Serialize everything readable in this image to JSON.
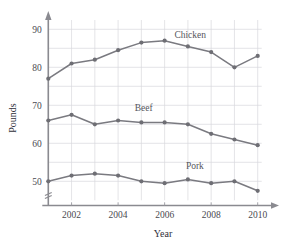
{
  "chart_data": {
    "type": "line",
    "title": "",
    "subtitle": "",
    "xlabel": "Year",
    "ylabel": "Pounds",
    "x": [
      2001,
      2002,
      2003,
      2004,
      2005,
      2006,
      2007,
      2008,
      2009,
      2010
    ],
    "xlim": [
      2001,
      2010
    ],
    "ylim": [
      46,
      92
    ],
    "xtick_labels": [
      "2002",
      "2004",
      "2006",
      "2008",
      "2010"
    ],
    "xtick_values": [
      2002,
      2004,
      2006,
      2008,
      2010
    ],
    "ytick_labels": [
      "50",
      "60",
      "70",
      "80",
      "90"
    ],
    "ytick_values": [
      50,
      60,
      70,
      80,
      90
    ],
    "grid": true,
    "grid_x_step": 1,
    "grid_y_step": 5,
    "y_axis_break": true,
    "legend_position": "inline-annotations",
    "series": [
      {
        "name": "Chicken",
        "label": "Chicken",
        "label_x": 2007.1,
        "label_y": 87.8,
        "color": "#7a7a80",
        "values": [
          77,
          81,
          82,
          84.5,
          86.5,
          87,
          85.5,
          84,
          80,
          83
        ]
      },
      {
        "name": "Beef",
        "label": "Beef",
        "label_x": 2005.1,
        "label_y": 68.4,
        "color": "#7a7a80",
        "values": [
          66,
          67.5,
          65,
          66,
          65.5,
          65.5,
          65,
          62.5,
          61,
          59.5
        ]
      },
      {
        "name": "Pork",
        "label": "Pork",
        "label_x": 2007.3,
        "label_y": 53.2,
        "color": "#7a7a80",
        "values": [
          50,
          51.5,
          52,
          51.5,
          50,
          49.5,
          50.5,
          49.5,
          50,
          47.5
        ]
      }
    ],
    "colors": {
      "line": "#7a7a80",
      "marker": "#6e6e74",
      "grid": "#d8d8dd",
      "axis": "#8a8a90",
      "text": "#4a4a50"
    }
  }
}
